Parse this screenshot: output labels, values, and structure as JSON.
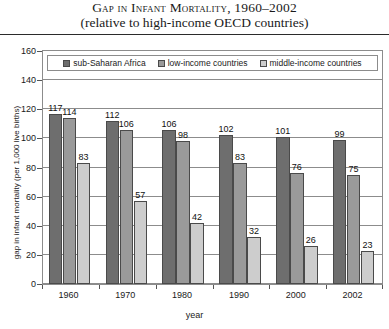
{
  "header": {
    "title": "Gap in Infant Mortality, 1960–2002",
    "subtitle": "(relative to high-income OECD countries)"
  },
  "chart_data": {
    "type": "bar",
    "title": "Gap in Infant Mortality, 1960–2002",
    "subtitle": "(relative to high-income OECD countries)",
    "xlabel": "year",
    "ylabel": "gap in infant mortality (per 1,000 live births)",
    "categories": [
      "1960",
      "1970",
      "1980",
      "1990",
      "2000",
      "2002"
    ],
    "series": [
      {
        "name": "sub-Saharan Africa",
        "color": "#6e6e6e",
        "values": [
          117,
          112,
          106,
          102,
          101,
          99
        ]
      },
      {
        "name": "low-income countries",
        "color": "#9a9a9a",
        "values": [
          114,
          106,
          98,
          83,
          76,
          75
        ]
      },
      {
        "name": "middle-income countries",
        "color": "#cdcdcd",
        "values": [
          83,
          57,
          42,
          32,
          26,
          23
        ]
      }
    ],
    "ylim": [
      0,
      160
    ],
    "yticks": [
      0,
      20,
      40,
      60,
      80,
      100,
      120,
      140,
      160
    ],
    "grid": "horizontal",
    "legend_position": "top-inside",
    "show_value_labels": true
  }
}
